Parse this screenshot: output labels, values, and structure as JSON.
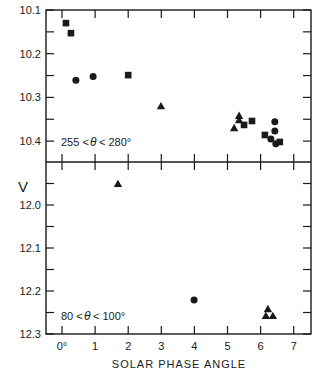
{
  "chart_data": {
    "type": "scatter",
    "title": "",
    "xlabel": "SOLAR PHASE ANGLE",
    "ylabel": "V",
    "xlim": [
      -0.5,
      7.5
    ],
    "x_ticks": [
      0,
      1,
      2,
      3,
      4,
      5,
      6,
      7
    ],
    "x_tick_labels": [
      "0°",
      "1",
      "2",
      "3",
      "4",
      "5",
      "6",
      "7"
    ],
    "grid": false,
    "legend": null,
    "marker_types": [
      "square",
      "circle",
      "triangle"
    ],
    "panels": [
      {
        "name": "top",
        "annotation": "255 < θ < 280°",
        "ylim": [
          10.1,
          10.448
        ],
        "y_inverted": true,
        "y_ticks_major": [
          10.1,
          10.2,
          10.3,
          10.4
        ],
        "y_tick_labels": [
          "10.1",
          "10.2",
          "10.3",
          "10.4"
        ],
        "y_ticks_minor": [
          10.15,
          10.25,
          10.35
        ],
        "points": [
          {
            "x": 0.12,
            "y": 10.13,
            "marker": "square"
          },
          {
            "x": 0.27,
            "y": 10.153,
            "marker": "square"
          },
          {
            "x": 0.42,
            "y": 10.261,
            "marker": "circle"
          },
          {
            "x": 0.94,
            "y": 10.252,
            "marker": "circle"
          },
          {
            "x": 2.0,
            "y": 10.249,
            "marker": "square"
          },
          {
            "x": 2.99,
            "y": 10.32,
            "marker": "triangle"
          },
          {
            "x": 5.35,
            "y": 10.342,
            "marker": "triangle"
          },
          {
            "x": 5.35,
            "y": 10.352,
            "marker": "triangle"
          },
          {
            "x": 5.2,
            "y": 10.37,
            "marker": "triangle"
          },
          {
            "x": 5.5,
            "y": 10.363,
            "marker": "square"
          },
          {
            "x": 5.74,
            "y": 10.354,
            "marker": "square"
          },
          {
            "x": 6.13,
            "y": 10.386,
            "marker": "square"
          },
          {
            "x": 6.43,
            "y": 10.356,
            "marker": "circle"
          },
          {
            "x": 6.43,
            "y": 10.377,
            "marker": "circle"
          },
          {
            "x": 6.31,
            "y": 10.395,
            "marker": "circle"
          },
          {
            "x": 6.46,
            "y": 10.406,
            "marker": "circle"
          },
          {
            "x": 6.58,
            "y": 10.402,
            "marker": "square"
          }
        ]
      },
      {
        "name": "bottom",
        "annotation": "80 < θ < 100°",
        "ylim": [
          11.9,
          12.3
        ],
        "y_inverted": true,
        "y_ticks_major": [
          12.0,
          12.1,
          12.2,
          12.3
        ],
        "y_tick_labels": [
          "12.0",
          "12.1",
          "12.2",
          "12.3"
        ],
        "y_ticks_minor": [
          11.95,
          12.05,
          12.15,
          12.25
        ],
        "points": [
          {
            "x": 1.69,
            "y": 11.951,
            "marker": "triangle"
          },
          {
            "x": 3.99,
            "y": 12.221,
            "marker": "circle"
          },
          {
            "x": 6.22,
            "y": 12.242,
            "marker": "triangle"
          },
          {
            "x": 6.16,
            "y": 12.258,
            "marker": "triangle"
          },
          {
            "x": 6.37,
            "y": 12.258,
            "marker": "triangle"
          }
        ]
      }
    ]
  },
  "labels": {
    "y_axis": "V",
    "x_axis": "SOLAR PHASE ANGLE",
    "top_annotation_left": "255 <",
    "top_annotation_theta": "θ",
    "top_annotation_right": "< 280°",
    "bottom_annotation_left": "80 <",
    "bottom_annotation_theta": "θ",
    "bottom_annotation_right": "< 100°"
  },
  "colors": {
    "ink": "#1a1a1a",
    "background": "#ffffff"
  }
}
